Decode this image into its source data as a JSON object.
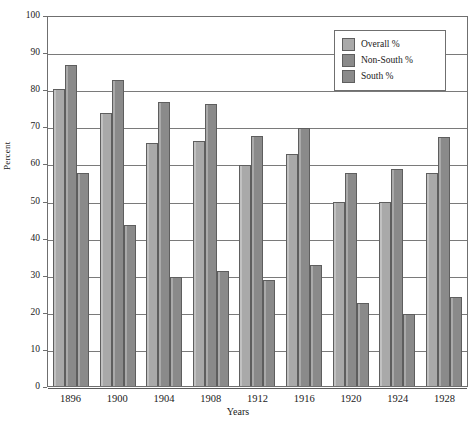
{
  "chart_data": {
    "type": "bar",
    "title": "",
    "xlabel": "Years",
    "ylabel": "Percent",
    "ylim": [
      0,
      100
    ],
    "ytick_step": 10,
    "yticks": [
      100,
      90,
      80,
      70,
      60,
      50,
      40,
      30,
      20,
      10,
      0
    ],
    "grid": true,
    "legend_position": "top-right",
    "categories": [
      "1896",
      "1900",
      "1904",
      "1908",
      "1912",
      "1916",
      "1920",
      "1924",
      "1928"
    ],
    "series": [
      {
        "name": "Overall %",
        "color": "#a9a9a9",
        "values": [
          80.0,
          73.5,
          65.5,
          66.0,
          59.5,
          62.5,
          49.5,
          49.5,
          57.5
        ]
      },
      {
        "name": "Non-South %",
        "color": "#8a8a8a",
        "values": [
          86.5,
          82.5,
          76.5,
          76.0,
          67.5,
          69.5,
          57.5,
          58.5,
          67.0
        ]
      },
      {
        "name": "South %",
        "color": "#8a8a8a",
        "values": [
          57.5,
          43.5,
          29.5,
          31.0,
          28.5,
          32.5,
          22.5,
          19.5,
          24.0
        ]
      }
    ]
  },
  "legend": {
    "items": [
      {
        "label": "Overall %"
      },
      {
        "label": "Non-South %"
      },
      {
        "label": "South %"
      }
    ]
  },
  "axes": {
    "y_title": "Percent",
    "x_title": "Years"
  }
}
